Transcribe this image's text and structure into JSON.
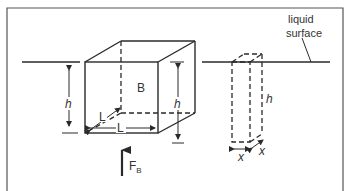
{
  "diagram": {
    "labels": {
      "liquid_surface_line1": "liquid",
      "liquid_surface_line2": "surface",
      "block": "B",
      "height_left": "h",
      "height_right": "h",
      "length_depth": "L",
      "length_width": "L",
      "buoyant_force": "F",
      "buoyant_force_sub": "B",
      "column_height": "h",
      "column_width": "x",
      "column_depth": "x"
    },
    "colors": {
      "line": "#2a2a2a",
      "frame": "#555555",
      "background": "#ffffff"
    }
  }
}
